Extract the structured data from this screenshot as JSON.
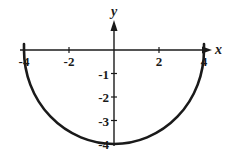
{
  "chart_data": {
    "type": "line",
    "title": "",
    "xlabel": "x",
    "ylabel": "y",
    "equation": "y = -sqrt(16 - x^2)",
    "xlim": [
      -4,
      4
    ],
    "ylim": [
      -4,
      0
    ],
    "grid": false,
    "legend": null,
    "x_ticks": [
      -4,
      -2,
      2,
      4
    ],
    "x_tick_labels": [
      "-4",
      "-2",
      "2",
      "4"
    ],
    "y_ticks": [
      -1,
      -2,
      -3,
      -4
    ],
    "y_tick_labels": [
      "-1",
      "-2",
      "-3",
      "-4"
    ],
    "series": [
      {
        "name": "lower semicircle",
        "x": [
          -4,
          -3.5,
          -3,
          -2.5,
          -2,
          -1.5,
          -1,
          -0.5,
          0,
          0.5,
          1,
          1.5,
          2,
          2.5,
          3,
          3.5,
          4
        ],
        "y": [
          0,
          -1.94,
          -2.65,
          -3.12,
          -3.46,
          -3.71,
          -3.87,
          -3.97,
          -4,
          -3.97,
          -3.87,
          -3.71,
          -3.46,
          -3.12,
          -2.65,
          -1.94,
          0
        ]
      }
    ]
  },
  "layout": {
    "origin_px": [
      114,
      50
    ],
    "unit_x_px": 22.5,
    "unit_y_px": 23.5,
    "axis_x_start_px": 20,
    "axis_x_end_px": 212,
    "axis_y_top_px": 20,
    "axis_y_bottom_px": 146,
    "stroke_color": "#1a1a1a"
  }
}
